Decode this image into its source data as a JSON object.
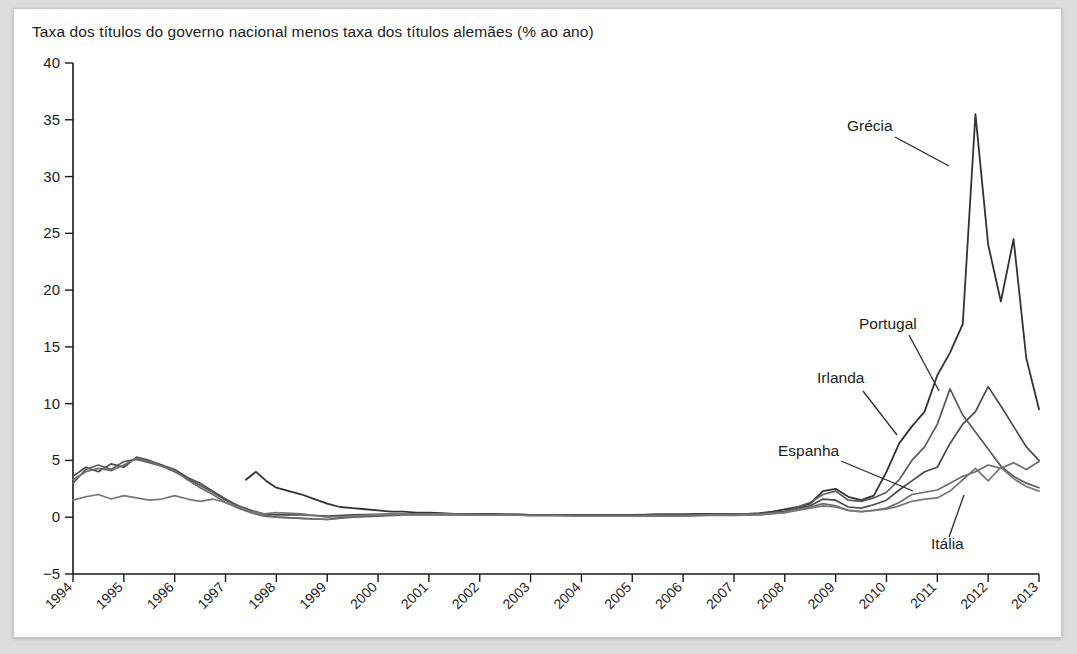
{
  "chart_data": {
    "type": "line",
    "title": "Taxa dos títulos do governo nacional menos taxa dos títulos alemães (% ao ano)",
    "xlabel": "",
    "ylabel": "",
    "ylim": [
      -5,
      40
    ],
    "xlim": [
      1994,
      2013
    ],
    "yticks": [
      "40",
      "35",
      "30",
      "25",
      "20",
      "15",
      "10",
      "5",
      "0",
      "-5"
    ],
    "ytick_values": [
      40,
      35,
      30,
      25,
      20,
      15,
      10,
      5,
      0,
      -5
    ],
    "xticks": [
      "1994",
      "1995",
      "1996",
      "1997",
      "1998",
      "1999",
      "2000",
      "2001",
      "2002",
      "2003",
      "2004",
      "2005",
      "2006",
      "2007",
      "2008",
      "2009",
      "2010",
      "2011",
      "2012",
      "2013"
    ],
    "xtick_values": [
      1994,
      1995,
      1996,
      1997,
      1998,
      1999,
      2000,
      2001,
      2002,
      2003,
      2004,
      2005,
      2006,
      2007,
      2008,
      2009,
      2010,
      2011,
      2012,
      2013
    ],
    "grid": false,
    "legend_position": "inline-annotations",
    "x_label_rotation": -45,
    "series": [
      {
        "name": "Grécia",
        "color": "#333333",
        "width": 1.8,
        "x": [
          1997.4,
          1997.6,
          1997.8,
          1998.0,
          1998.25,
          1998.5,
          1998.75,
          1999.0,
          1999.25,
          1999.5,
          1999.75,
          2000.0,
          2000.25,
          2000.5,
          2000.75,
          2001.0,
          2001.25,
          2001.5,
          2001.75,
          2002.0,
          2002.25,
          2002.5,
          2002.75,
          2003.0,
          2003.25,
          2003.5,
          2003.75,
          2004.0,
          2004.25,
          2004.5,
          2004.75,
          2005.0,
          2005.25,
          2005.5,
          2005.75,
          2006.0,
          2006.25,
          2006.5,
          2006.75,
          2007.0,
          2007.25,
          2007.5,
          2007.75,
          2008.0,
          2008.25,
          2008.5,
          2008.75,
          2009.0,
          2009.25,
          2009.5,
          2009.75,
          2010.0,
          2010.25,
          2010.5,
          2010.75,
          2011.0,
          2011.25,
          2011.5,
          2011.75,
          2012.0,
          2012.25,
          2012.5,
          2012.75,
          2013.0
        ],
        "y": [
          3.3,
          4.0,
          3.2,
          2.6,
          2.3,
          2.0,
          1.6,
          1.2,
          0.9,
          0.8,
          0.7,
          0.6,
          0.5,
          0.5,
          0.4,
          0.4,
          0.35,
          0.3,
          0.3,
          0.3,
          0.3,
          0.25,
          0.25,
          0.2,
          0.2,
          0.2,
          0.2,
          0.2,
          0.2,
          0.2,
          0.2,
          0.2,
          0.2,
          0.25,
          0.25,
          0.25,
          0.3,
          0.3,
          0.3,
          0.3,
          0.3,
          0.35,
          0.5,
          0.7,
          0.9,
          1.2,
          2.3,
          2.5,
          1.8,
          1.5,
          1.9,
          4.0,
          6.5,
          8.0,
          9.3,
          12.5,
          14.5,
          17.0,
          35.5,
          24.0,
          19.0,
          24.5,
          14.0,
          9.5
        ],
        "label_note": "pico 35,5 em 2011-2012"
      },
      {
        "name": "Portugal",
        "color": "#4a4a4a",
        "width": 1.7,
        "x": [
          1994.0,
          1994.25,
          1994.5,
          1994.75,
          1995.0,
          1995.25,
          1995.5,
          1995.75,
          1996.0,
          1996.25,
          1996.5,
          1996.75,
          1997.0,
          1997.25,
          1997.5,
          1997.75,
          1998.0,
          1998.5,
          1999.0,
          1999.5,
          2000.0,
          2000.5,
          2001.0,
          2001.5,
          2002.0,
          2002.5,
          2003.0,
          2003.5,
          2004.0,
          2004.5,
          2005.0,
          2005.5,
          2006.0,
          2006.5,
          2007.0,
          2007.5,
          2008.0,
          2008.25,
          2008.5,
          2008.75,
          2009.0,
          2009.25,
          2009.5,
          2009.75,
          2010.0,
          2010.25,
          2010.5,
          2010.75,
          2011.0,
          2011.25,
          2011.5,
          2011.75,
          2012.0,
          2012.25,
          2012.5,
          2012.75,
          2013.0
        ],
        "y": [
          3.6,
          4.4,
          4.0,
          4.7,
          4.4,
          5.3,
          5.0,
          4.6,
          4.2,
          3.5,
          3.0,
          2.3,
          1.6,
          1.0,
          0.6,
          0.3,
          0.2,
          0.2,
          0.1,
          0.2,
          0.25,
          0.3,
          0.3,
          0.3,
          0.3,
          0.25,
          0.2,
          0.2,
          0.2,
          0.2,
          0.2,
          0.25,
          0.25,
          0.25,
          0.3,
          0.3,
          0.5,
          0.8,
          1.0,
          1.6,
          1.5,
          0.9,
          0.8,
          1.1,
          1.5,
          2.4,
          3.2,
          4.0,
          4.4,
          6.5,
          8.2,
          9.3,
          11.5,
          9.8,
          8.0,
          6.2,
          5.0
        ]
      },
      {
        "name": "Irlanda",
        "color": "#5a5a5a",
        "width": 1.7,
        "x": [
          1994.0,
          1994.25,
          1994.5,
          1994.75,
          1995.0,
          1995.25,
          1995.5,
          1995.75,
          1996.0,
          1996.25,
          1996.5,
          1996.75,
          1997.0,
          1997.25,
          1997.5,
          1997.75,
          1998.0,
          1998.5,
          1999.0,
          1999.5,
          2000.0,
          2000.5,
          2001.0,
          2001.5,
          2002.0,
          2002.5,
          2003.0,
          2003.5,
          2004.0,
          2004.5,
          2005.0,
          2005.5,
          2006.0,
          2006.5,
          2007.0,
          2007.5,
          2008.0,
          2008.25,
          2008.5,
          2008.75,
          2009.0,
          2009.25,
          2009.5,
          2009.75,
          2010.0,
          2010.25,
          2010.5,
          2010.75,
          2011.0,
          2011.25,
          2011.5,
          2011.75,
          2012.0,
          2012.25,
          2012.5,
          2012.75,
          2013.0
        ],
        "y": [
          3.0,
          4.2,
          4.6,
          4.2,
          4.9,
          5.1,
          4.8,
          4.5,
          4.0,
          3.4,
          2.8,
          2.2,
          1.5,
          1.0,
          0.5,
          0.2,
          0.0,
          -0.1,
          -0.2,
          0.0,
          0.1,
          0.2,
          0.2,
          0.2,
          0.2,
          0.2,
          0.15,
          0.15,
          0.15,
          0.15,
          0.15,
          0.2,
          0.2,
          0.2,
          0.25,
          0.3,
          0.5,
          0.9,
          1.3,
          2.0,
          2.3,
          1.5,
          1.4,
          1.7,
          2.2,
          3.3,
          5.0,
          6.2,
          8.2,
          11.3,
          9.0,
          7.5,
          6.0,
          4.5,
          3.6,
          3.0,
          2.6
        ]
      },
      {
        "name": "Espanha",
        "color": "#6e6e6e",
        "width": 1.7,
        "x": [
          1994.0,
          1994.25,
          1994.5,
          1994.75,
          1995.0,
          1995.25,
          1995.5,
          1995.75,
          1996.0,
          1996.25,
          1996.5,
          1996.75,
          1997.0,
          1997.25,
          1997.5,
          1997.75,
          1998.0,
          1998.5,
          1999.0,
          1999.5,
          2000.0,
          2000.5,
          2001.0,
          2001.5,
          2002.0,
          2002.5,
          2003.0,
          2003.5,
          2004.0,
          2004.5,
          2005.0,
          2005.5,
          2006.0,
          2006.5,
          2007.0,
          2007.5,
          2008.0,
          2008.25,
          2008.5,
          2008.75,
          2009.0,
          2009.25,
          2009.5,
          2009.75,
          2010.0,
          2010.25,
          2010.5,
          2010.75,
          2011.0,
          2011.25,
          2011.5,
          2011.75,
          2012.0,
          2012.25,
          2012.5,
          2012.75,
          2013.0
        ],
        "y": [
          3.3,
          4.0,
          4.3,
          4.1,
          4.6,
          5.2,
          4.9,
          4.5,
          4.1,
          3.3,
          2.6,
          2.0,
          1.3,
          0.8,
          0.4,
          0.1,
          0.0,
          -0.1,
          -0.2,
          0.1,
          0.2,
          0.3,
          0.3,
          0.25,
          0.2,
          0.2,
          0.15,
          0.15,
          0.1,
          0.1,
          0.1,
          0.1,
          0.1,
          0.15,
          0.15,
          0.2,
          0.4,
          0.7,
          0.9,
          1.2,
          1.0,
          0.6,
          0.5,
          0.6,
          0.8,
          1.3,
          2.0,
          2.2,
          2.4,
          3.0,
          3.6,
          4.0,
          4.6,
          4.3,
          4.8,
          4.2,
          4.9
        ]
      },
      {
        "name": "Itália",
        "color": "#777777",
        "width": 1.7,
        "x": [
          1994.0,
          1994.25,
          1994.5,
          1994.75,
          1995.0,
          1995.25,
          1995.5,
          1995.75,
          1996.0,
          1996.25,
          1996.5,
          1996.75,
          1997.0,
          1997.25,
          1997.5,
          1997.75,
          1998.0,
          1998.5,
          1999.0,
          1999.5,
          2000.0,
          2000.5,
          2001.0,
          2001.5,
          2002.0,
          2002.5,
          2003.0,
          2003.5,
          2004.0,
          2004.5,
          2005.0,
          2005.5,
          2006.0,
          2006.5,
          2007.0,
          2007.5,
          2008.0,
          2008.25,
          2008.5,
          2008.75,
          2009.0,
          2009.25,
          2009.5,
          2009.75,
          2010.0,
          2010.25,
          2010.5,
          2010.75,
          2011.0,
          2011.25,
          2011.5,
          2011.75,
          2012.0,
          2012.25,
          2012.5,
          2012.75,
          2013.0
        ],
        "y": [
          1.5,
          1.8,
          2.0,
          1.6,
          1.9,
          1.7,
          1.5,
          1.6,
          1.9,
          1.6,
          1.4,
          1.6,
          1.3,
          0.9,
          0.5,
          0.3,
          0.4,
          0.3,
          0.0,
          0.1,
          0.2,
          0.3,
          0.3,
          0.25,
          0.2,
          0.2,
          0.15,
          0.15,
          0.1,
          0.1,
          0.1,
          0.1,
          0.1,
          0.2,
          0.2,
          0.25,
          0.4,
          0.6,
          0.8,
          1.0,
          0.9,
          0.6,
          0.5,
          0.6,
          0.7,
          1.0,
          1.4,
          1.6,
          1.7,
          2.3,
          3.3,
          4.3,
          3.2,
          4.4,
          3.4,
          2.7,
          2.3
        ]
      }
    ],
    "annotations": [
      {
        "text": "Grécia",
        "lx": 846,
        "ly": 130,
        "x1": 894,
        "y1": 136,
        "x2": 948,
        "y2": 165
      },
      {
        "text": "Portugal",
        "lx": 858,
        "ly": 328,
        "x1": 908,
        "y1": 334,
        "x2": 938,
        "y2": 390
      },
      {
        "text": "Irlanda",
        "lx": 816,
        "ly": 382,
        "x1": 862,
        "y1": 390,
        "x2": 896,
        "y2": 434
      },
      {
        "text": "Espanha",
        "lx": 777,
        "ly": 455,
        "x1": 840,
        "y1": 460,
        "x2": 912,
        "y2": 490
      },
      {
        "text": "Itália",
        "lx": 930,
        "ly": 548,
        "x1": 948,
        "y1": 536,
        "x2": 963,
        "y2": 494
      }
    ]
  }
}
